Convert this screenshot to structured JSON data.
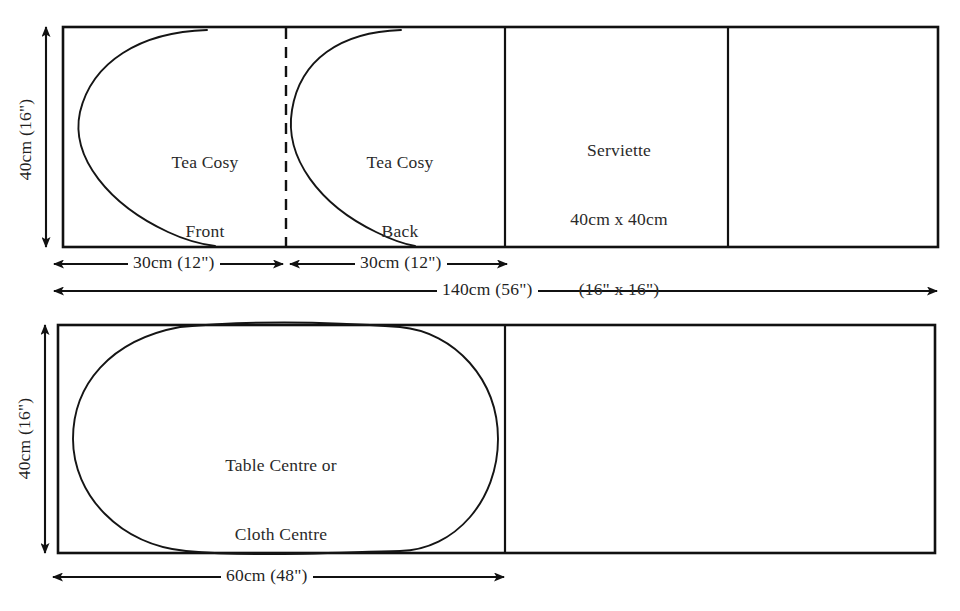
{
  "diagram": {
    "stroke_color": "#111111",
    "background_color": "#ffffff",
    "text_color": "#2a2a2a",
    "layouts": [
      {
        "id": "top-layout",
        "fabric_width_label": "140cm (56\")",
        "fabric_height_label": "40cm (16\")",
        "pieces": [
          {
            "id": "tea-cosy-front",
            "label_line1": "Tea Cosy",
            "label_line2": "Front",
            "width_label": "30cm (12\")"
          },
          {
            "id": "tea-cosy-back",
            "label_line1": "Tea Cosy",
            "label_line2": "Back",
            "width_label": "30cm (12\")"
          },
          {
            "id": "serviette",
            "label_line1": "Serviette",
            "label_line2": "40cm x 40cm",
            "label_line3": "(16\" x 16\")"
          }
        ]
      },
      {
        "id": "bottom-layout",
        "fabric_width_label": "60cm (48\")",
        "fabric_height_label": "40cm (16\")",
        "pieces": [
          {
            "id": "table-centre",
            "label_line1": "Table Centre or",
            "label_line2": "Cloth Centre"
          }
        ]
      }
    ]
  }
}
